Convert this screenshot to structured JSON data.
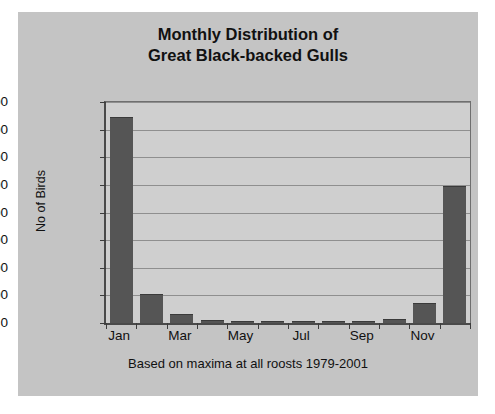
{
  "chart_data": {
    "type": "bar",
    "title": "Monthly Distribution of Great Black-backed Gulls",
    "title_lines": [
      "Monthly Distribution of",
      "Great Black-backed Gulls"
    ],
    "subtitle": "Based on maxima at all roosts 1979-2001",
    "xlabel": "",
    "ylabel": "No of Birds",
    "ylim": [
      0,
      16000
    ],
    "ytick_labels": [
      "16000",
      "14000",
      "12000",
      "10000",
      "8000",
      "6000",
      "4000",
      "2000",
      "0"
    ],
    "ytick_values": [
      16000,
      14000,
      12000,
      10000,
      8000,
      6000,
      4000,
      2000,
      0
    ],
    "grid": true,
    "legend": false,
    "categories": [
      "Jan",
      "Feb",
      "Mar",
      "Apr",
      "May",
      "Jun",
      "Jul",
      "Aug",
      "Sep",
      "Oct",
      "Nov",
      "Dec"
    ],
    "xtick_labels_shown": [
      "Jan",
      "",
      "Mar",
      "",
      "May",
      "",
      "Jul",
      "",
      "Sep",
      "",
      "Nov",
      ""
    ],
    "values": [
      14900,
      2100,
      650,
      200,
      120,
      110,
      130,
      150,
      120,
      300,
      1450,
      9900
    ],
    "bar_color": "#555555",
    "plot_background": "#cfcfcf",
    "chart_background": "#c4c4c4",
    "page_background": "#ffffff"
  }
}
